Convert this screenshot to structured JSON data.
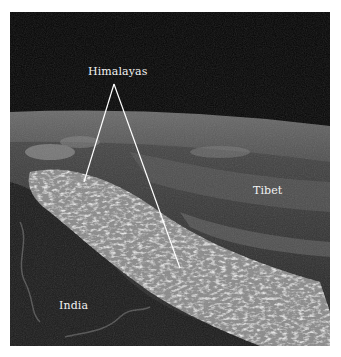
{
  "figure": {
    "type": "satellite-photo",
    "labels": {
      "himalayas": "Himalayas",
      "tibet": "Tibet",
      "india": "India"
    },
    "colors": {
      "space": "#050505",
      "land_dark": "#2a2a2a",
      "snow": "#d8d8d8",
      "label_text": "#f2f2f2",
      "pointer_line": "#ffffff"
    }
  }
}
